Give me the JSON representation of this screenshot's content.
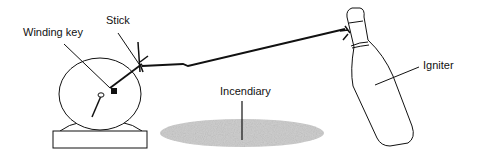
{
  "diagram": {
    "type": "illustration",
    "labels": {
      "winding_key": "Winding key",
      "stick": "Stick",
      "incendiary": "Incendiary",
      "igniter": "Igniter"
    },
    "components": [
      {
        "id": "clock",
        "description": "Alarm clock with winding key and hand"
      },
      {
        "id": "stick",
        "description": "Stick attached to clock hand"
      },
      {
        "id": "string",
        "description": "String from stick to bottle neck"
      },
      {
        "id": "bottle",
        "description": "Tilted bottle (igniter)"
      },
      {
        "id": "incendiary",
        "description": "Pool of incendiary material on ground"
      }
    ],
    "colors": {
      "line": "#111111",
      "incendiary_fill": "#cfcfcf",
      "background": "#ffffff"
    }
  }
}
